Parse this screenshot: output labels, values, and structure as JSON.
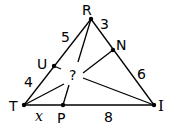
{
  "diagram": {
    "type": "triangle-cevians",
    "vertices": {
      "R": {
        "label": "R",
        "x": 91,
        "y": 19
      },
      "T": {
        "label": "T",
        "x": 24,
        "y": 105
      },
      "I": {
        "label": "I",
        "x": 154,
        "y": 105
      }
    },
    "points": {
      "U": {
        "label": "U",
        "x": 54,
        "y": 66,
        "on": "RT"
      },
      "N": {
        "label": "N",
        "x": 113,
        "y": 50,
        "on": "RI"
      },
      "P": {
        "label": "P",
        "x": 63,
        "y": 105,
        "on": "TI"
      }
    },
    "segment_labels": {
      "RU": "5",
      "UT": "4",
      "RN": "3",
      "NI": "6",
      "TP": "x",
      "PI": "8"
    },
    "center_label": "?",
    "cevians": [
      "RP",
      "TN",
      "IU"
    ]
  }
}
